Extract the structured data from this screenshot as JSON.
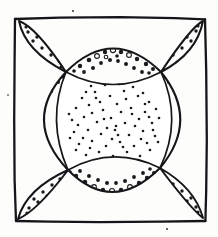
{
  "figure": {
    "title": "Quilt block line drawing",
    "medium": "pen and ink line drawing",
    "canvas": {
      "width": 218,
      "height": 237
    },
    "colors": {
      "ink": "#16161a",
      "paper": "#fdfdfc",
      "fill_white": "#ffffff",
      "dot": "#1a1a1e"
    },
    "frame": {
      "name": "outer square border",
      "left": 14,
      "top": 17,
      "right": 206,
      "bottom": 221,
      "stroke_width": 2.3,
      "hand_drawn": true
    },
    "nodes": {
      "description": "four arc intersection points where petals meet",
      "top_left": {
        "x": 66,
        "y": 72
      },
      "top_right": {
        "x": 161,
        "y": 72
      },
      "bottom_left": {
        "x": 68,
        "y": 170
      },
      "bottom_right": {
        "x": 160,
        "y": 168
      }
    },
    "regions": [
      {
        "name": "center-stipple",
        "shape": "concave square",
        "fill": "fine stipple",
        "dot_count": 74,
        "dot_radius": 1.3
      },
      {
        "name": "band-top",
        "shape": "lens crescent",
        "fill": "heavy dots",
        "dot_count": 22,
        "dot_radius": 2.3
      },
      {
        "name": "band-bottom",
        "shape": "lens crescent",
        "fill": "heavy dots",
        "dot_count": 24,
        "dot_radius": 2.3
      },
      {
        "name": "band-left",
        "shape": "lens crescent",
        "fill": "heavy dots",
        "dot_count": 20,
        "dot_radius": 2.3
      },
      {
        "name": "band-right",
        "shape": "lens crescent",
        "fill": "heavy dots",
        "dot_count": 20,
        "dot_radius": 2.3
      },
      {
        "name": "petal-top-left",
        "shape": "pointed oval",
        "fill": "medium dots",
        "dot_count": 15,
        "dot_radius": 1.7
      },
      {
        "name": "petal-top-right",
        "shape": "pointed oval",
        "fill": "medium dots",
        "dot_count": 15,
        "dot_radius": 1.7
      },
      {
        "name": "petal-bottom-left",
        "shape": "pointed oval",
        "fill": "medium dots",
        "dot_count": 14,
        "dot_radius": 1.7
      },
      {
        "name": "petal-bottom-right",
        "shape": "pointed oval",
        "fill": "medium dots",
        "dot_count": 14,
        "dot_radius": 1.7
      }
    ]
  }
}
